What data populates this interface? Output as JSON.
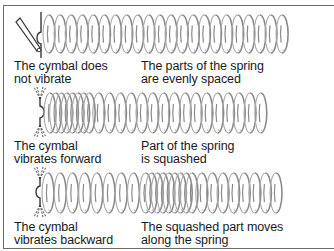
{
  "figure": {
    "type": "physics-diagram",
    "colors": {
      "spring": "#8a8a8a",
      "spring_back": "#a8a8a8",
      "cymbal": "#3a3a3a",
      "frame": "#6b6b6b",
      "text": "#1a1a1a"
    },
    "panels": [
      {
        "id": "rest",
        "cymbal_state": "still, struck by stick",
        "spring_state": "evenly spaced",
        "left_caption": [
          "The cymbal does",
          "not vibrate"
        ],
        "right_caption": [
          "The parts of the spring",
          "are evenly spaced"
        ]
      },
      {
        "id": "forward",
        "cymbal_state": "vibrating forward",
        "spring_state": "compressed near cymbal",
        "left_caption": [
          "The cymbal",
          "vibrates forward"
        ],
        "right_caption": [
          "Part of the spring",
          "is squashed"
        ]
      },
      {
        "id": "backward",
        "cymbal_state": "vibrating backward",
        "spring_state": "compression moved along the middle",
        "left_caption": [
          "The cymbal",
          "vibrates backward"
        ],
        "right_caption": [
          "The squashed part moves",
          "along the spring"
        ]
      }
    ]
  }
}
